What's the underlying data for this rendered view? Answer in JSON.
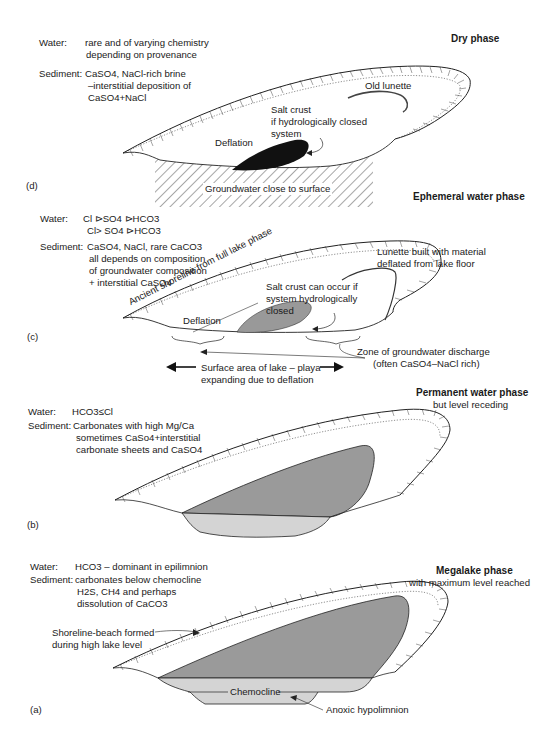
{
  "figure": {
    "panels": [
      {
        "id": "(d)",
        "title": "Dry phase",
        "subtitle": "",
        "water_label": "Water:",
        "water_lines": [
          "rare and of varying chemistry",
          "depending on provenance"
        ],
        "sediment_label": "Sediment:",
        "sediment_lines": [
          "CaSO4, NaCl-rich brine",
          "–interstitial deposition of",
          "CaSO4+NaCl"
        ],
        "annotations": {
          "old_lunette": "Old lunette",
          "salt_crust": [
            "Salt crust",
            "if hydrologically closed",
            "system"
          ],
          "deflation": "Deflation",
          "groundwater": "Groundwater close to surface"
        }
      },
      {
        "id": "(c)",
        "title": "Ephemeral water phase",
        "subtitle": "",
        "water_label": "Water:",
        "water_lines": [
          "Cl ⊳SO4 ⊳HCO3",
          "Cl> SO4 ⊳HCO3"
        ],
        "sediment_label": "Sediment:",
        "sediment_lines": [
          "CaSO4, NaCl, rare CaCO3",
          "all depends on composition",
          "of groundwater composition",
          "+ interstitial CaSO4"
        ],
        "annotations": {
          "ancient_shoreline": "Ancient shoreline from full lake phase",
          "lunette": [
            "Lunette built with material",
            "deflated from lake floor"
          ],
          "salt_crust": [
            "Salt crust can occur if",
            "system hydrologically",
            "closed"
          ],
          "deflation": "Deflation",
          "groundwater_zone": [
            "Zone of groundwater discharge",
            "(often CaSO4–NaCl rich)"
          ],
          "surface_area": [
            "Surface area of lake – playa",
            "expanding due to deflation"
          ]
        }
      },
      {
        "id": "(b)",
        "title": "Permanent water phase",
        "subtitle": "but level receding",
        "water_label": "Water:",
        "water_lines": [
          "HCO3≤Cl"
        ],
        "sediment_label": "Sediment:",
        "sediment_lines": [
          "Carbonates with high Mg/Ca",
          "sometimes CaSo4+interstitial",
          "carbonate sheets and CaSO4"
        ],
        "annotations": {}
      },
      {
        "id": "(a)",
        "title": "Megalake phase",
        "subtitle": "with maximum level reached",
        "water_label": "Water:",
        "water_lines": [
          "HCO3 – dominant in epilimnion"
        ],
        "sediment_label": "Sediment:",
        "sediment_lines": [
          "carbonates below chemocline",
          "H2S, CH4 and perhaps",
          "dissolution of CaCO3"
        ],
        "annotations": {
          "shoreline_beach": [
            "Shoreline-beach formed",
            "during high lake level"
          ],
          "chemocline": "Chemocline",
          "anoxic": "Anoxic hypolimnion"
        }
      }
    ],
    "colors": {
      "ink": "#1a1a1a",
      "lake_dark": "#9a9a9a",
      "lake_light": "#d4d4d4",
      "salt_crust_c": "#999999"
    }
  }
}
